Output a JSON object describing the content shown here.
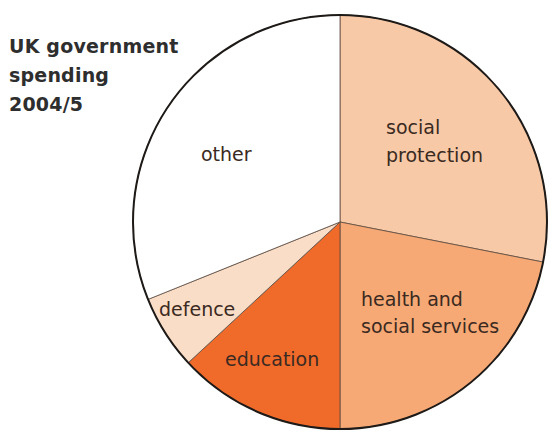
{
  "chart_data": {
    "type": "pie",
    "title": "UK government spending 2004/5",
    "title_lines": [
      "UK government",
      "spending",
      "2004/5"
    ],
    "start_angle_deg": 0,
    "direction": "clockwise",
    "slices": [
      {
        "label": "social protection",
        "label_lines": [
          "social",
          "protection"
        ],
        "value": 28.1,
        "color": "#F8C9A6"
      },
      {
        "label": "health and social services",
        "label_lines": [
          "health and",
          "social services"
        ],
        "value": 21.9,
        "color": "#F6A975"
      },
      {
        "label": "education",
        "label_lines": [
          "education"
        ],
        "value": 13.1,
        "color": "#F06A2A"
      },
      {
        "label": "defence",
        "label_lines": [
          "defence"
        ],
        "value": 5.8,
        "color": "#FADDC6"
      },
      {
        "label": "other",
        "label_lines": [
          "other"
        ],
        "value": 31.1,
        "color": "#FFFFFF"
      }
    ],
    "categories": [
      "social protection",
      "health and social services",
      "education",
      "defence",
      "other"
    ],
    "values": [
      28.1,
      21.9,
      13.1,
      5.8,
      31.1
    ],
    "unit": "% (estimated from slice angles)",
    "legend": "none (labels inside slices)"
  },
  "title": {
    "line1": "UK government",
    "line2": "spending",
    "line3": "2004/5"
  },
  "labels": {
    "social_1": "social",
    "social_2": "protection",
    "health_1": "health and",
    "health_2": "social services",
    "education": "education",
    "defence": "defence",
    "other": "other"
  }
}
